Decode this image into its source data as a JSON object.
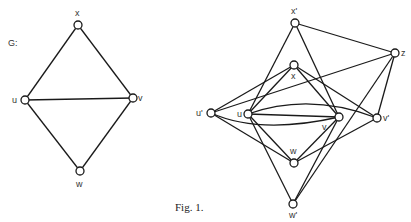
{
  "figure": {
    "caption": "Fig. 1.",
    "graph_label": "G:"
  },
  "graph_g": {
    "nodes": [
      {
        "id": "x",
        "label": "x",
        "cx": 78,
        "cy": 25
      },
      {
        "id": "u",
        "label": "u",
        "cx": 25,
        "cy": 100
      },
      {
        "id": "v",
        "label": "v",
        "cx": 133,
        "cy": 98
      },
      {
        "id": "w",
        "label": "w",
        "cx": 80,
        "cy": 171
      }
    ],
    "edges": [
      [
        "x",
        "u"
      ],
      [
        "x",
        "v"
      ],
      [
        "u",
        "v"
      ],
      [
        "u",
        "w"
      ],
      [
        "v",
        "w"
      ]
    ]
  },
  "graph_right": {
    "nodes": [
      {
        "id": "x'",
        "label": "x'",
        "cx": 295,
        "cy": 23
      },
      {
        "id": "z",
        "label": "z",
        "cx": 395,
        "cy": 53
      },
      {
        "id": "x",
        "label": "x",
        "cx": 294,
        "cy": 65
      },
      {
        "id": "u'",
        "label": "u'",
        "cx": 211,
        "cy": 113
      },
      {
        "id": "u",
        "label": "u",
        "cx": 248,
        "cy": 114
      },
      {
        "id": "v",
        "label": "v",
        "cx": 339,
        "cy": 117
      },
      {
        "id": "v'",
        "label": "v'",
        "cx": 377,
        "cy": 118
      },
      {
        "id": "w",
        "label": "w",
        "cx": 294,
        "cy": 163
      },
      {
        "id": "w'",
        "label": "w'",
        "cx": 293,
        "cy": 204
      }
    ],
    "edges": [
      [
        "x'",
        "z"
      ],
      [
        "x'",
        "u"
      ],
      [
        "x'",
        "v"
      ],
      [
        "x",
        "u'"
      ],
      [
        "x",
        "u"
      ],
      [
        "x",
        "v"
      ],
      [
        "x",
        "v'"
      ],
      [
        "u'",
        "z"
      ],
      [
        "u'",
        "w"
      ],
      [
        "u'",
        "v (arc)"
      ],
      [
        "u",
        "v"
      ],
      [
        "u",
        "v' (arc)"
      ],
      [
        "u",
        "w"
      ],
      [
        "u",
        "w'"
      ],
      [
        "v",
        "w"
      ],
      [
        "v",
        "w'"
      ],
      [
        "v'",
        "z"
      ],
      [
        "v'",
        "w"
      ],
      [
        "z",
        "w'"
      ]
    ]
  }
}
